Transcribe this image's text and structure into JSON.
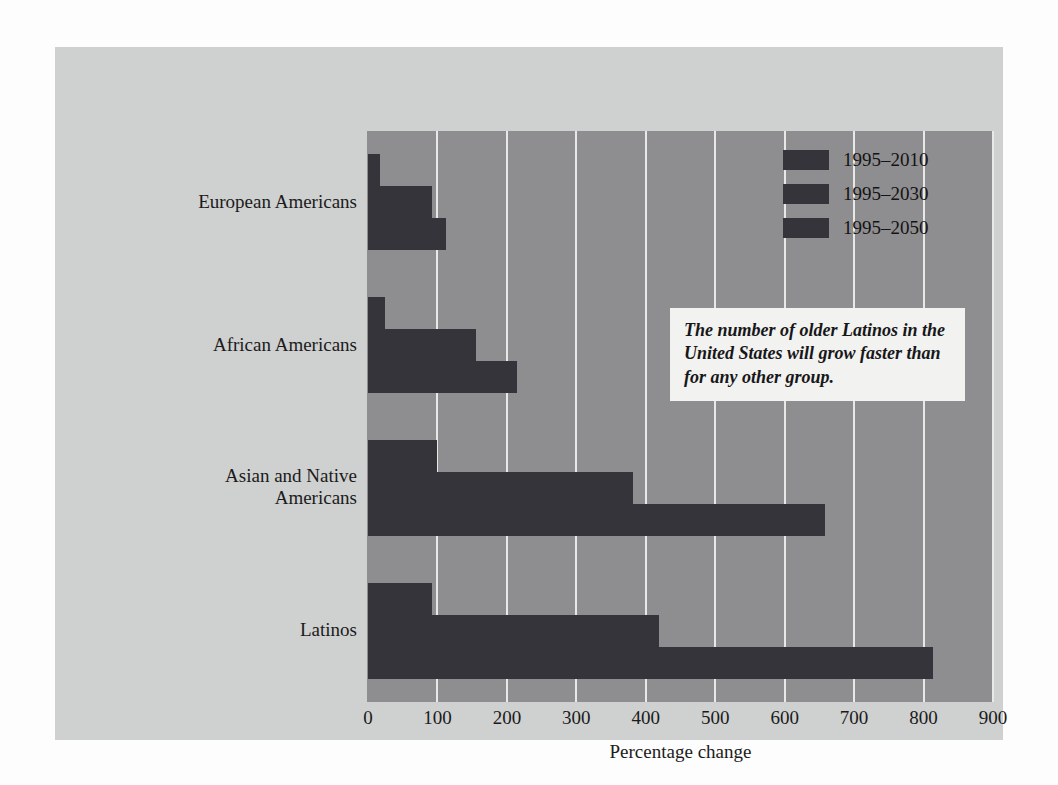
{
  "chart_data": {
    "type": "bar",
    "orientation": "horizontal",
    "title": "",
    "xlabel": "Percentage change",
    "ylabel": "",
    "xlim": [
      0,
      900
    ],
    "xticks": [
      0,
      100,
      200,
      300,
      400,
      500,
      600,
      700,
      800,
      900
    ],
    "grid": true,
    "legend_position": "top-right",
    "categories": [
      "European Americans",
      "African Americans",
      "Asian and Native Americans",
      "Latinos"
    ],
    "series": [
      {
        "name": "1995–2010",
        "values": [
          17,
          25,
          100,
          92
        ]
      },
      {
        "name": "1995–2030",
        "values": [
          92,
          155,
          382,
          419
        ]
      },
      {
        "name": "1995–2050",
        "values": [
          112,
          215,
          658,
          814
        ]
      }
    ],
    "annotations": [
      "The number of older Latinos in the United States will grow faster than for any other group."
    ],
    "colors": {
      "bar": "#35343a",
      "plot_background": "#8e8e90",
      "gridline": "#e8e8e6",
      "card_background": "#cfd0d0",
      "page_background": "#fdfdfd",
      "callout_background": "#f2f2f0",
      "text": "#1b1b1b"
    }
  },
  "category_labels": [
    {
      "line1": "European Americans",
      "line2": ""
    },
    {
      "line1": "African Americans",
      "line2": ""
    },
    {
      "line1": "Asian and Native",
      "line2": "Americans"
    },
    {
      "line1": "Latinos",
      "line2": ""
    }
  ],
  "callout": {
    "text": "The number of older Latinos in the United States will grow faster than for any other group."
  }
}
